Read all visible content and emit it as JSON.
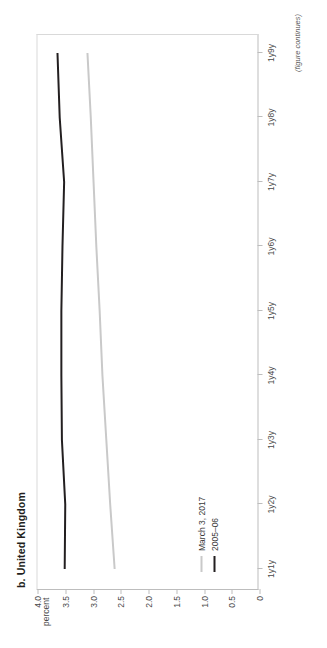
{
  "figure": {
    "panel_label": "b. United Kingdom",
    "note": "(figure continues)"
  },
  "colors": {
    "series_2005_06": "#231f20",
    "series_march_2017": "#c9c9c9",
    "axis": "#bdbdbd",
    "text": "#3a3a3a"
  },
  "chart_data": {
    "type": "line",
    "title": "b. United Kingdom",
    "xlabel": "",
    "ylabel": "percent",
    "grid": false,
    "legend_position": "bottom-left",
    "x": [
      "1y1y",
      "1y2y",
      "1y3y",
      "1y4y",
      "1y5y",
      "1y6y",
      "1y7y",
      "1y8y",
      "1y9y"
    ],
    "xtick_labels": [
      "1y1y",
      "1y2y",
      "1y3y",
      "1y4y",
      "1y5y",
      "1y6y",
      "1y7y",
      "1y8y",
      "1y9y"
    ],
    "ytick_labels": [
      "4.0",
      "3.5",
      "3.0",
      "2.5",
      "2.0",
      "1.5",
      "1.0",
      "0.5",
      "0"
    ],
    "ytick_values": [
      4.0,
      3.5,
      3.0,
      2.5,
      2.0,
      1.5,
      1.0,
      0.5,
      0
    ],
    "ylim": [
      0,
      4.0
    ],
    "series": [
      {
        "name": "March 3, 2017",
        "color": "#c9c9c9",
        "values": [
          2.61,
          2.69,
          2.76,
          2.83,
          2.88,
          2.94,
          2.99,
          3.04,
          3.1
        ]
      },
      {
        "name": "2005–06",
        "color": "#231f20",
        "values": [
          3.51,
          3.5,
          3.56,
          3.57,
          3.57,
          3.55,
          3.52,
          3.6,
          3.64
        ]
      }
    ]
  }
}
